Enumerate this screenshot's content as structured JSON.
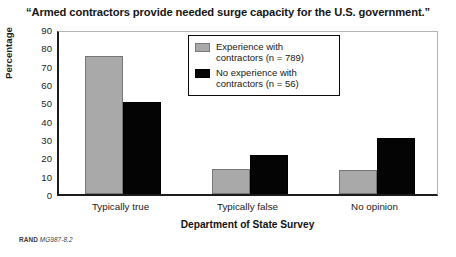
{
  "chart_data": {
    "type": "bar",
    "title": "“Armed contractors provide needed surge capacity for the U.S. government.”",
    "xlabel": "Department of State Survey",
    "ylabel": "Percentage",
    "categories": [
      "Typically true",
      "Typically false",
      "No opinion"
    ],
    "series": [
      {
        "name": "Experience with contractors (n = 789)",
        "color": "#a9a9a9",
        "values": [
          75.5,
          13.5,
          13
        ]
      },
      {
        "name": "No experience with contractors (n = 56)",
        "color": "#040404",
        "values": [
          50,
          21.5,
          30.5
        ]
      }
    ],
    "ylim": [
      0,
      90
    ],
    "yticks": [
      0,
      10,
      20,
      30,
      40,
      50,
      60,
      70,
      80,
      90
    ],
    "ytick_labels": [
      "0",
      "10",
      "20",
      "30",
      "40",
      "50",
      "60",
      "70",
      "80",
      "90"
    ],
    "grid": false,
    "legend_position": "top-center"
  },
  "legend": {
    "entries": [
      {
        "line1": "Experience with",
        "line2": "contractors (n = 789)"
      },
      {
        "line1": "No experience with",
        "line2": "contractors (n = 56)"
      }
    ]
  },
  "footer": {
    "rand_mark": "RAND",
    "doc_id": "MG987-8.2"
  }
}
